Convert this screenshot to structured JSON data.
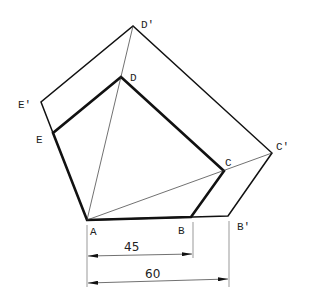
{
  "diagram": {
    "points": {
      "A": {
        "label": "A",
        "x": 87,
        "y": 220
      },
      "B": {
        "label": "B",
        "x": 191,
        "y": 217
      },
      "C": {
        "label": "C",
        "x": 224,
        "y": 171
      },
      "D": {
        "label": "D",
        "x": 121,
        "y": 77
      },
      "E": {
        "label": "E",
        "x": 53,
        "y": 133
      },
      "Bp": {
        "label": "B'",
        "x": 228,
        "y": 216
      },
      "Cp": {
        "label": "C'",
        "x": 272,
        "y": 153
      },
      "Dp": {
        "label": "D'",
        "x": 133,
        "y": 26
      },
      "Ep": {
        "label": "E'",
        "x": 41,
        "y": 102
      }
    },
    "dimensions": [
      {
        "label": "45",
        "from": "A",
        "to": "B"
      },
      {
        "label": "60",
        "from": "A",
        "to": "B'"
      }
    ],
    "colors": {
      "line": "#111111",
      "background": "#ffffff"
    }
  }
}
